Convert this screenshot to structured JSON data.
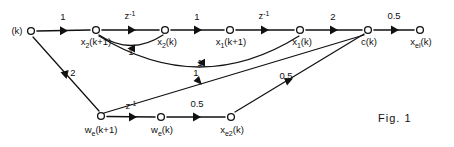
{
  "figure": {
    "caption": "Fig. 1",
    "type": "signal-flow-graph",
    "width": 454,
    "height": 147,
    "line_color": "#111111",
    "background_color": "#ffffff"
  },
  "nodes": [
    {
      "id": "u",
      "label": "(k)",
      "base": "(k)",
      "sub": "",
      "tail": "",
      "x": 31,
      "y": 31,
      "label_x": 17,
      "label_y": 34,
      "anchor": "middle"
    },
    {
      "id": "x2kp1",
      "label": "x2(k+1)",
      "base": "x",
      "sub": "2",
      "tail": "(k+1)",
      "x": 96,
      "y": 30,
      "label_x": 96,
      "label_y": 45,
      "anchor": "middle"
    },
    {
      "id": "x2k",
      "label": "x2(k)",
      "base": "x",
      "sub": "2",
      "tail": "(k)",
      "x": 165,
      "y": 30,
      "label_x": 167,
      "label_y": 45,
      "anchor": "middle"
    },
    {
      "id": "x1kp1",
      "label": "x1(k+1)",
      "base": "x",
      "sub": "1",
      "tail": "(k+1)",
      "x": 230,
      "y": 30,
      "label_x": 231,
      "label_y": 45,
      "anchor": "middle"
    },
    {
      "id": "x1k",
      "label": "x1(k)",
      "base": "x",
      "sub": "1",
      "tail": "(k)",
      "x": 300,
      "y": 30,
      "label_x": 302,
      "label_y": 45,
      "anchor": "middle"
    },
    {
      "id": "ck",
      "label": "c(k)",
      "base": "c(k)",
      "sub": "",
      "tail": "",
      "x": 368,
      "y": 30,
      "label_x": 369,
      "label_y": 45,
      "anchor": "middle"
    },
    {
      "id": "xelk",
      "label": "xel(k)",
      "base": "x",
      "sub": "el",
      "tail": "(k)",
      "x": 420,
      "y": 30,
      "label_x": 421,
      "label_y": 45,
      "anchor": "middle"
    },
    {
      "id": "wekp1",
      "label": "we(k+1)",
      "base": "w",
      "sub": "e",
      "tail": "(k+1)",
      "x": 101,
      "y": 116,
      "label_x": 101,
      "label_y": 133,
      "anchor": "middle"
    },
    {
      "id": "wek",
      "label": "we(k)",
      "base": "w",
      "sub": "e",
      "tail": "(k)",
      "x": 161,
      "y": 117,
      "label_x": 162,
      "label_y": 133,
      "anchor": "middle"
    },
    {
      "id": "xe2k",
      "label": "xe2(k)",
      "base": "x",
      "sub": "e2",
      "tail": "(k)",
      "x": 231,
      "y": 117,
      "label_x": 232,
      "label_y": 133,
      "anchor": "middle"
    }
  ],
  "edges": [
    {
      "id": "e1",
      "from": "u",
      "to": "x2kp1",
      "gain": "1",
      "gain_base": "1",
      "gain_sup": "",
      "gain_x": 63,
      "gain_y": 20,
      "kind": "straight"
    },
    {
      "id": "e2",
      "from": "x2kp1",
      "to": "x2k",
      "gain": "z-1",
      "gain_base": "z",
      "gain_sup": "-1",
      "gain_x": 130,
      "gain_y": 19,
      "kind": "straight"
    },
    {
      "id": "e3",
      "from": "x2k",
      "to": "x1kp1",
      "gain": "1",
      "gain_base": "1",
      "gain_sup": "",
      "gain_x": 197,
      "gain_y": 20,
      "kind": "straight"
    },
    {
      "id": "e4",
      "from": "x1kp1",
      "to": "x1k",
      "gain": "z-1",
      "gain_base": "z",
      "gain_sup": "-1",
      "gain_x": 264,
      "gain_y": 19,
      "kind": "straight"
    },
    {
      "id": "e5",
      "from": "x1k",
      "to": "ck",
      "gain": "2",
      "gain_base": "2",
      "gain_sup": "",
      "gain_x": 333,
      "gain_y": 20,
      "kind": "straight"
    },
    {
      "id": "e6",
      "from": "ck",
      "to": "xelk",
      "gain": "0.5",
      "gain_base": "0.5",
      "gain_sup": "",
      "gain_x": 394,
      "gain_y": 19,
      "kind": "straight"
    },
    {
      "id": "e7",
      "from": "x2k",
      "to": "x2kp1",
      "gain": "1",
      "gain_base": "1",
      "gain_sup": "",
      "gain_x": 131,
      "gain_y": 55,
      "kind": "curve-short-feedback"
    },
    {
      "id": "e8",
      "from": "x1k",
      "to": "x2kp1",
      "gain": "1",
      "gain_base": "1",
      "gain_sup": "",
      "gain_x": 200,
      "gain_y": 66,
      "kind": "curve-long-feedback"
    },
    {
      "id": "e9",
      "from": "u",
      "to": "wekp1",
      "gain": "2",
      "gain_base": "2",
      "gain_sup": "",
      "gain_x": 73,
      "gain_y": 76,
      "kind": "straight-diagonal"
    },
    {
      "id": "e10",
      "from": "ck",
      "to": "wekp1",
      "gain": "1",
      "gain_base": "1",
      "gain_sup": "",
      "gain_x": 196,
      "gain_y": 76,
      "kind": "straight-diagonal"
    },
    {
      "id": "e11",
      "from": "wekp1",
      "to": "wek",
      "gain": "z-1",
      "gain_base": "z",
      "gain_sup": "-1",
      "gain_x": 131,
      "gain_y": 109,
      "kind": "straight"
    },
    {
      "id": "e12",
      "from": "wek",
      "to": "xe2k",
      "gain": "0.5",
      "gain_base": "0.5",
      "gain_sup": "",
      "gain_x": 197,
      "gain_y": 107,
      "kind": "straight"
    },
    {
      "id": "e13",
      "from": "xe2k",
      "to": "ck",
      "gain": "0.5",
      "gain_base": "0.5",
      "gain_sup": "",
      "gain_x": 286,
      "gain_y": 79,
      "kind": "straight-diagonal"
    }
  ],
  "caption_position": {
    "x": 378,
    "y": 122
  }
}
